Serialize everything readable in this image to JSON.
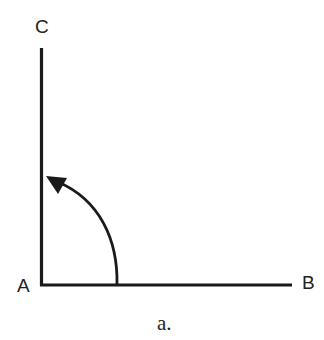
{
  "diagram": {
    "points": [
      {
        "id": "A",
        "label": "A"
      },
      {
        "id": "B",
        "label": "B"
      },
      {
        "id": "C",
        "label": "C"
      }
    ],
    "segments": [
      "AB",
      "AC"
    ],
    "angle": {
      "vertex": "A",
      "from": "AB",
      "to": "AC",
      "arrow": "counterclockwise"
    },
    "caption": "a.",
    "colors": {
      "stroke": "#1a1a1a",
      "background": "#ffffff"
    }
  }
}
